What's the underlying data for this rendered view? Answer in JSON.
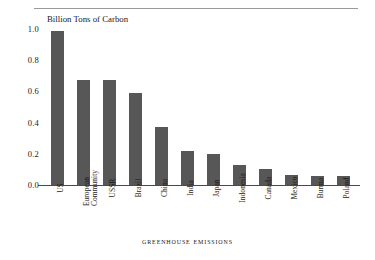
{
  "chart_data": {
    "type": "bar",
    "title": "Billion Tons of Carbon",
    "caption": "Greenhouse Emissions",
    "xlabel": "",
    "ylabel": "",
    "ylim": [
      0.0,
      1.0
    ],
    "grid": false,
    "legend": "none",
    "bar_color": "#575757",
    "axis_color": "#4a4a4a",
    "ytick_labels": [
      "1.0",
      "0.8",
      "0.6",
      "0.4",
      "0.2",
      "0.0"
    ],
    "ytick_values": [
      1.0,
      0.8,
      0.6,
      0.4,
      0.2,
      0.0
    ],
    "categories": [
      "US",
      "European Community",
      "USSR",
      "Brazil",
      "China",
      "India",
      "Japan",
      "Indonesia",
      "Canada",
      "Mexico",
      "Burma",
      "Poland"
    ],
    "category_lines": [
      [
        "US"
      ],
      [
        "European",
        "Community"
      ],
      [
        "USSR"
      ],
      [
        "Brazil"
      ],
      [
        "China"
      ],
      [
        "India"
      ],
      [
        "Japan"
      ],
      [
        "Indonesia"
      ],
      [
        "Canada"
      ],
      [
        "Mexico"
      ],
      [
        "Burma"
      ],
      [
        "Poland"
      ]
    ],
    "values": [
      0.99,
      0.67,
      0.67,
      0.59,
      0.37,
      0.215,
      0.2,
      0.13,
      0.105,
      0.065,
      0.06,
      0.055
    ]
  }
}
